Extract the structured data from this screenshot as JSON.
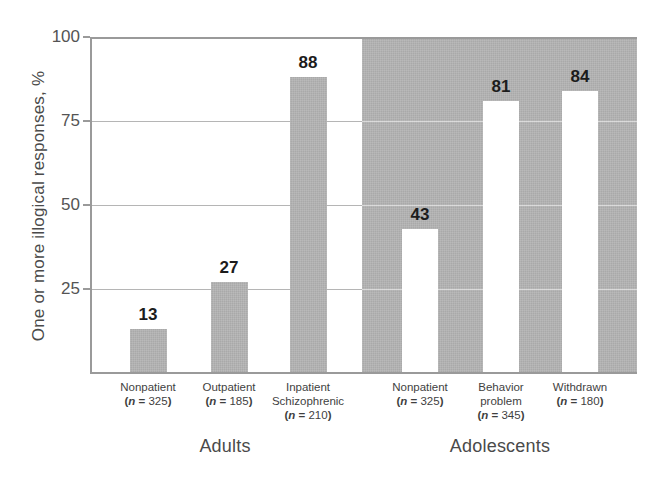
{
  "chart_data": {
    "type": "bar",
    "title": "",
    "xlabel": "",
    "ylabel": "One or more illogical responses, %",
    "ylim": [
      0,
      100
    ],
    "yticks": [
      25,
      50,
      75,
      100
    ],
    "grid": true,
    "legend": false,
    "value_labels": true,
    "categories": [
      "Nonpatient",
      "Outpatient",
      "Inpatient Schizophrenic",
      "Nonpatient",
      "Behavior problem",
      "Withdrawn"
    ],
    "values": [
      13,
      27,
      88,
      43,
      81,
      84
    ],
    "sample_sizes": [
      325,
      185,
      210,
      325,
      345,
      180
    ],
    "groups": [
      {
        "label": "Adults",
        "category_indices": [
          0,
          1,
          2
        ]
      },
      {
        "label": "Adolescents",
        "category_indices": [
          3,
          4,
          5
        ]
      }
    ]
  },
  "axis": {
    "y_title": "One or more illogical responses, %",
    "ticks": [
      {
        "value": "100"
      },
      {
        "value": "75"
      },
      {
        "value": "50"
      },
      {
        "value": "25"
      }
    ]
  },
  "bars": [
    {
      "value": 13,
      "value_label": "13",
      "name_line1": "Nonpatient",
      "name_line2": "",
      "n_prefix": "(",
      "n_var": "n",
      "n_eq": " = ",
      "n_value": "325",
      "n_suffix": ")",
      "style": "gray"
    },
    {
      "value": 27,
      "value_label": "27",
      "name_line1": "Outpatient",
      "name_line2": "",
      "n_prefix": "(",
      "n_var": "n",
      "n_eq": " = ",
      "n_value": "185",
      "n_suffix": ")",
      "style": "gray"
    },
    {
      "value": 88,
      "value_label": "88",
      "name_line1": "Inpatient",
      "name_line2": "Schizophrenic",
      "n_prefix": "(",
      "n_var": "n",
      "n_eq": " = ",
      "n_value": "210",
      "n_suffix": ")",
      "style": "gray"
    },
    {
      "value": 43,
      "value_label": "43",
      "name_line1": "Nonpatient",
      "name_line2": "",
      "n_prefix": "(",
      "n_var": "n",
      "n_eq": " = ",
      "n_value": "325",
      "n_suffix": ")",
      "style": "white"
    },
    {
      "value": 81,
      "value_label": "81",
      "name_line1": "Behavior",
      "name_line2": "problem",
      "n_prefix": "(",
      "n_var": "n",
      "n_eq": " = ",
      "n_value": "345",
      "n_suffix": ")",
      "style": "white"
    },
    {
      "value": 84,
      "value_label": "84",
      "name_line1": "Withdrawn",
      "name_line2": "",
      "n_prefix": "(",
      "n_var": "n",
      "n_eq": " = ",
      "n_value": "180",
      "n_suffix": ")",
      "style": "white"
    }
  ],
  "groups": [
    {
      "label": "Adults"
    },
    {
      "label": "Adolescents"
    }
  ],
  "colors": {
    "bar_gray": "#a9a9a9",
    "bar_white": "#ffffff",
    "panel_gray": "#a9a9a9",
    "panel_white": "#ffffff",
    "frame": "#9a9a9a",
    "gridline": "#b5b5b5",
    "text": "#3f3f3f"
  }
}
